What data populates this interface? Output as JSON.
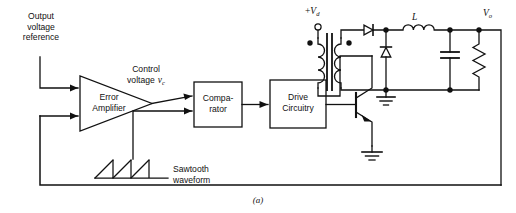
{
  "figure": {
    "caption": "(a)"
  },
  "labels": {
    "output_voltage_reference": "Output\nvoltage\nreference",
    "output_voltage_reference_lines": [
      "Output",
      "voltage",
      "reference"
    ],
    "error_amplifier_lines": [
      "Error",
      "Amplifier"
    ],
    "control_voltage_line1": "Control",
    "control_voltage_line2": "voltage",
    "control_voltage_symbol": "v",
    "control_voltage_subscript": "c",
    "comparator_lines": [
      "Compa-",
      "rator"
    ],
    "drive_circuitry_lines": [
      "Drive",
      "Circuitry"
    ],
    "sawtooth_lines": [
      "Sawtooth",
      "waveform"
    ],
    "supply_sign": "+",
    "supply_symbol": "V",
    "supply_subscript": "d",
    "inductor_symbol": "L",
    "output_symbol": "V",
    "output_subscript": "o"
  },
  "components": {
    "error_amplifier": "error-amplifier-triangle",
    "comparator": "comparator-block",
    "drive_circuitry": "drive-circuitry-block",
    "transistor": "npn-bjt-switch",
    "transformer": "isolation-transformer",
    "rectifier_diode": "rectifier-diode",
    "freewheeling_diode": "freewheeling-diode",
    "filter_inductor": "filter-inductor",
    "filter_capacitor": "filter-capacitor",
    "load_resistor": "load-resistor",
    "primary_ground": "primary-ground",
    "secondary_ground": "secondary-ground",
    "supply_terminal": "supply-terminal-circle",
    "feedback_path": "output-feedback-loop",
    "sawtooth_generator": "sawtooth-waveform"
  },
  "colors": {
    "line": "#111111",
    "background": "#ffffff",
    "text": "#111111"
  }
}
